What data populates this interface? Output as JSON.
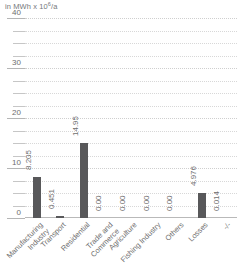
{
  "chart_data": {
    "type": "bar",
    "title": "",
    "unit_caption": "in MWh x 10",
    "unit_exponent": "6",
    "unit_suffix": "/a",
    "ylabel": "in MWh x 10^6/a",
    "xlabel": "",
    "ylim": [
      0,
      40
    ],
    "y_ticks_major": [
      0,
      10,
      20,
      30,
      40
    ],
    "y_tick_labels": [
      "0",
      "10",
      "20",
      "30",
      "40"
    ],
    "y_minor_step": 2.5,
    "grid": true,
    "legend": false,
    "bar_color": "#58585a",
    "text_color": "#6e6e6e",
    "grid_color": "#d8d8d8",
    "axis_color": "#b5b5b5",
    "categories": [
      "Manufacturing\nIndustry",
      "Transport",
      "Residential",
      "Trade and\nCommerce",
      "Agriculture",
      "Fishing Industry",
      "Others",
      "Losses",
      "-/-"
    ],
    "values": [
      8.205,
      0.451,
      14.95,
      0.0,
      0.0,
      0.0,
      0.0,
      4.976,
      0.014
    ],
    "value_labels": [
      "8.205",
      "0.451",
      "14.95",
      "0.00",
      "0.00",
      "0.00",
      "0.00",
      "4.976",
      "0.014"
    ]
  }
}
